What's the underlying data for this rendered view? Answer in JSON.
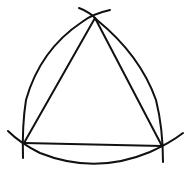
{
  "diagram": {
    "title": "Equilateral triangle construction with compass arcs",
    "stroke_color": "#111111",
    "background": "#ffffff",
    "vertices": {
      "top": [
        95,
        18
      ],
      "bottom_left": [
        24,
        143
      ],
      "bottom_right": [
        162,
        146
      ]
    },
    "elements": [
      "triangle-side-left",
      "triangle-side-right",
      "triangle-side-base",
      "arc-left",
      "arc-right",
      "arc-bottom"
    ]
  }
}
